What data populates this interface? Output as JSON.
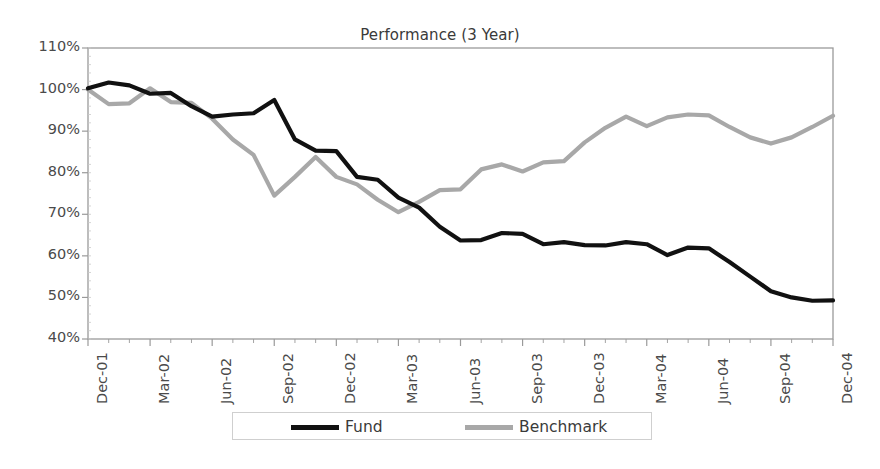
{
  "chart_data": {
    "type": "line",
    "title": "Performance (3 Year)",
    "xlabel": "",
    "ylabel": "",
    "ylim": [
      40,
      110
    ],
    "ytick_values": [
      110,
      100,
      90,
      80,
      70,
      60,
      50,
      40
    ],
    "ytick_labels": [
      "110%",
      "100%",
      "90%",
      "80%",
      "70%",
      "60%",
      "50%",
      "40%"
    ],
    "grid": false,
    "legend_position": "bottom",
    "x": [
      "Dec-01",
      "Jan-02",
      "Feb-02",
      "Mar-02",
      "Apr-02",
      "May-02",
      "Jun-02",
      "Jul-02",
      "Aug-02",
      "Sep-02",
      "Oct-02",
      "Nov-02",
      "Dec-02",
      "Jan-03",
      "Feb-03",
      "Mar-03",
      "Apr-03",
      "May-03",
      "Jun-03",
      "Jul-03",
      "Aug-03",
      "Sep-03",
      "Oct-03",
      "Nov-03",
      "Dec-03",
      "Jan-04",
      "Feb-04",
      "Mar-04",
      "Apr-04",
      "May-04",
      "Jun-04",
      "Jul-04",
      "Aug-04",
      "Sep-04",
      "Oct-04",
      "Nov-04",
      "Dec-04"
    ],
    "xtick_labels": [
      "Dec-01",
      "Mar-02",
      "Jun-02",
      "Sep-02",
      "Dec-02",
      "Mar-03",
      "Jun-03",
      "Sep-03",
      "Dec-03",
      "Mar-04",
      "Jun-04",
      "Sep-04",
      "Dec-04"
    ],
    "xtick_indices": [
      0,
      3,
      6,
      9,
      12,
      15,
      18,
      21,
      24,
      27,
      30,
      33,
      36
    ],
    "series": [
      {
        "name": "Fund",
        "color": "#111111",
        "values": [
          100.3,
          101.7,
          101.0,
          99.0,
          99.2,
          96.0,
          93.5,
          94.0,
          94.3,
          97.5,
          88.0,
          85.3,
          85.2,
          79.0,
          78.3,
          74.0,
          71.6,
          67.0,
          63.7,
          63.8,
          65.5,
          65.3,
          62.8,
          63.3,
          62.6,
          62.5,
          63.3,
          62.8,
          60.2,
          62.0,
          61.8,
          58.5,
          55.0,
          51.5,
          50.0,
          49.2,
          49.3
        ],
        "style": "solid",
        "width": 4.2
      },
      {
        "name": "Benchmark",
        "color": "#a8a8a8",
        "values": [
          100.0,
          96.5,
          96.7,
          100.3,
          97.0,
          96.8,
          93.0,
          88.0,
          84.3,
          74.5,
          79.0,
          83.8,
          79.0,
          77.2,
          73.5,
          70.5,
          73.0,
          75.8,
          76.0,
          80.8,
          82.0,
          80.3,
          82.5,
          82.8,
          87.3,
          90.8,
          93.5,
          91.2,
          93.3,
          94.0,
          93.8,
          91.0,
          88.5,
          87.0,
          88.5,
          91.0,
          93.7
        ],
        "style": "solid",
        "width": 4.2
      }
    ]
  },
  "legend": {
    "entries": [
      {
        "label": "Fund",
        "color": "#111111"
      },
      {
        "label": "Benchmark",
        "color": "#a8a8a8"
      }
    ]
  },
  "axis": {
    "frame_color": "#9a9a9a",
    "tick_color": "#9a9a9a"
  }
}
